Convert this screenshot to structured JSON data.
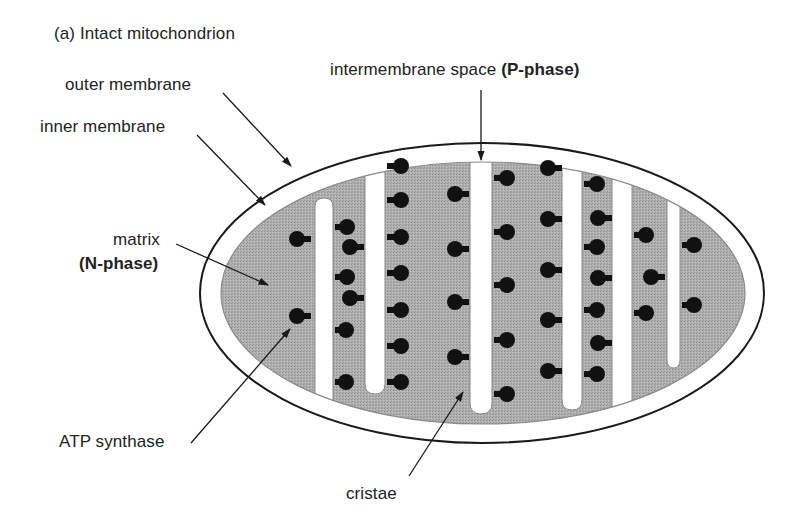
{
  "figure": {
    "title": "(a) Intact mitochondrion"
  },
  "labels": {
    "outer_membrane": "outer membrane",
    "inner_membrane": "inner membrane",
    "intermembrane_space": "intermembrane space ",
    "intermembrane_space_phase": "(P-phase)",
    "matrix": "matrix",
    "matrix_phase": "(N-phase)",
    "atp_synthase": "ATP synthase",
    "cristae": "cristae"
  },
  "colors": {
    "matrix_fill": "#a9a9a9",
    "membrane_stroke": "#1a1a1a",
    "atp_synthase": "#111111",
    "background": "#ffffff"
  }
}
